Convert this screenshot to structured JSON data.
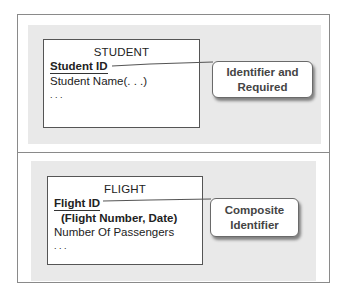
{
  "sections": [
    {
      "entity": {
        "title": "STUDENT",
        "identifier": "Student ID",
        "attributes": [
          "Student Name(. . .)",
          ". . ."
        ]
      },
      "callout": {
        "line1": "Identifier and",
        "line2": "Required"
      }
    },
    {
      "entity": {
        "title": "FLIGHT",
        "identifier": "Flight ID",
        "identifier_components": "(Flight Number, Date)",
        "attributes": [
          "Number Of Passengers",
          ". . ."
        ]
      },
      "callout": {
        "line1": "Composite",
        "line2": "Identifier"
      }
    }
  ],
  "colors": {
    "panel": "#e9e9e9",
    "border": "#8a8a8a",
    "callout_text": "#444444"
  }
}
